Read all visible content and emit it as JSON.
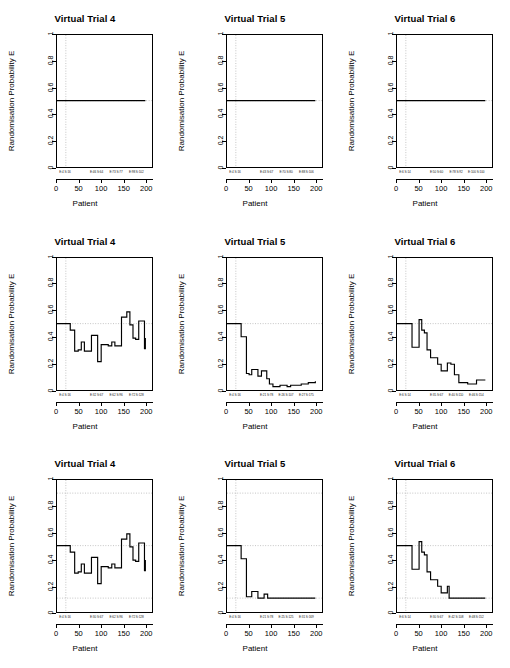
{
  "figure": {
    "rows": 3,
    "cols": 3,
    "axis_title_x": "Patient",
    "axis_title_y": "Randomisation Probability E",
    "line_color": "#000000",
    "grid_color": "#9a9a9a",
    "background": "#ffffff"
  },
  "chart_data": [
    {
      "type": "line",
      "title": "Virtual Trial 4",
      "xlabel": "Patient",
      "ylabel": "Randomisation Probability E",
      "xlim": [
        0,
        215
      ],
      "ylim": [
        0,
        1
      ],
      "xticks": [
        0,
        50,
        100,
        150,
        200
      ],
      "yticks": [
        0.0,
        0.2,
        0.4,
        0.6,
        0.8,
        1.0
      ],
      "grid": false,
      "vlines": [
        20
      ],
      "hlines": [
        0.5
      ],
      "step": true,
      "annotations": [
        {
          "x": 20,
          "text": "E:4 S:16"
        },
        {
          "x": 90,
          "text": "E:46 S:64"
        },
        {
          "x": 133,
          "text": "E:73 S:77"
        },
        {
          "x": 178,
          "text": "E:98 S:102"
        }
      ],
      "x": [
        0,
        20,
        200
      ],
      "values": [
        0.5,
        0.5,
        0.5
      ]
    },
    {
      "type": "line",
      "title": "Virtual Trial 5",
      "xlabel": "Patient",
      "ylabel": "Randomisation Probability E",
      "xlim": [
        0,
        215
      ],
      "ylim": [
        0,
        1
      ],
      "xticks": [
        0,
        50,
        100,
        150,
        200
      ],
      "yticks": [
        0.0,
        0.2,
        0.4,
        0.6,
        0.8,
        1.0
      ],
      "grid": false,
      "vlines": [
        20
      ],
      "hlines": [
        0.5
      ],
      "step": true,
      "annotations": [
        {
          "x": 20,
          "text": "E:4 S:16"
        },
        {
          "x": 90,
          "text": "E:43 S:67"
        },
        {
          "x": 133,
          "text": "E:70 S:80"
        },
        {
          "x": 178,
          "text": "E:88 S:106"
        }
      ],
      "x": [
        0,
        20,
        200
      ],
      "values": [
        0.5,
        0.5,
        0.5
      ]
    },
    {
      "type": "line",
      "title": "Virtual Trial 6",
      "xlabel": "Patient",
      "ylabel": "Randomisation Probability E",
      "xlim": [
        0,
        215
      ],
      "ylim": [
        0,
        1
      ],
      "xticks": [
        0,
        50,
        100,
        150,
        200
      ],
      "yticks": [
        0.0,
        0.2,
        0.4,
        0.6,
        0.8,
        1.0
      ],
      "grid": false,
      "vlines": [
        20
      ],
      "hlines": [
        0.5
      ],
      "step": true,
      "annotations": [
        {
          "x": 20,
          "text": "E:6 S:14"
        },
        {
          "x": 90,
          "text": "E:50 S:60"
        },
        {
          "x": 133,
          "text": "E:78 S:92"
        },
        {
          "x": 178,
          "text": "E:100 S:100"
        }
      ],
      "x": [
        0,
        20,
        200
      ],
      "values": [
        0.5,
        0.5,
        0.5
      ]
    },
    {
      "type": "line",
      "title": "Virtual Trial 4",
      "xlabel": "Patient",
      "ylabel": "Randomisation Probability E",
      "xlim": [
        0,
        215
      ],
      "ylim": [
        0,
        1
      ],
      "xticks": [
        0,
        50,
        100,
        150,
        200
      ],
      "yticks": [
        0.0,
        0.2,
        0.4,
        0.6,
        0.8,
        1.0
      ],
      "grid": false,
      "vlines": [
        20
      ],
      "hlines": [
        0.5
      ],
      "step": true,
      "annotations": [
        {
          "x": 20,
          "text": "E:4 S:16"
        },
        {
          "x": 90,
          "text": "E:32 S:67"
        },
        {
          "x": 133,
          "text": "E:62 S:96"
        },
        {
          "x": 178,
          "text": "E:72 S:128"
        }
      ],
      "x": [
        0,
        20,
        30,
        40,
        48,
        55,
        62,
        70,
        78,
        84,
        92,
        100,
        108,
        116,
        124,
        131,
        138,
        146,
        152,
        158,
        165,
        172,
        178,
        185,
        192,
        198,
        200
      ],
      "values": [
        0.5,
        0.5,
        0.45,
        0.29,
        0.3,
        0.36,
        0.29,
        0.29,
        0.41,
        0.41,
        0.21,
        0.34,
        0.34,
        0.33,
        0.36,
        0.33,
        0.33,
        0.55,
        0.55,
        0.59,
        0.49,
        0.39,
        0.38,
        0.52,
        0.52,
        0.31,
        0.39
      ]
    },
    {
      "type": "line",
      "title": "Virtual Trial 5",
      "xlabel": "Patient",
      "ylabel": "Randomisation Probability E",
      "xlim": [
        0,
        215
      ],
      "ylim": [
        0,
        1
      ],
      "xticks": [
        0,
        50,
        100,
        150,
        200
      ],
      "yticks": [
        0.0,
        0.2,
        0.4,
        0.6,
        0.8,
        1.0
      ],
      "grid": false,
      "vlines": [
        20
      ],
      "hlines": [
        0.5
      ],
      "step": true,
      "annotations": [
        {
          "x": 20,
          "text": "E:4 S:16"
        },
        {
          "x": 90,
          "text": "E:21 S:78"
        },
        {
          "x": 133,
          "text": "E:26 S:107"
        },
        {
          "x": 178,
          "text": "E:27 S:175"
        }
      ],
      "x": [
        0,
        20,
        32,
        38,
        44,
        50,
        56,
        62,
        70,
        78,
        84,
        90,
        96,
        104,
        112,
        120,
        128,
        136,
        144,
        152,
        160,
        168,
        176,
        184,
        192,
        200
      ],
      "values": [
        0.5,
        0.5,
        0.4,
        0.4,
        0.12,
        0.11,
        0.15,
        0.15,
        0.1,
        0.14,
        0.14,
        0.08,
        0.04,
        0.02,
        0.02,
        0.03,
        0.03,
        0.02,
        0.03,
        0.03,
        0.03,
        0.04,
        0.04,
        0.05,
        0.05,
        0.06
      ]
    },
    {
      "type": "line",
      "title": "Virtual Trial 6",
      "xlabel": "Patient",
      "ylabel": "Randomisation Probability E",
      "xlim": [
        0,
        215
      ],
      "ylim": [
        0,
        1
      ],
      "xticks": [
        0,
        50,
        100,
        150,
        200
      ],
      "yticks": [
        0.0,
        0.2,
        0.4,
        0.6,
        0.8,
        1.0
      ],
      "grid": false,
      "vlines": [
        20
      ],
      "hlines": [
        0.5
      ],
      "step": true,
      "annotations": [
        {
          "x": 20,
          "text": "E:6 S:14"
        },
        {
          "x": 90,
          "text": "E:35 S:67"
        },
        {
          "x": 133,
          "text": "E:40 S:110"
        },
        {
          "x": 178,
          "text": "E:46 S:154"
        }
      ],
      "x": [
        0,
        20,
        28,
        34,
        42,
        50,
        56,
        62,
        68,
        76,
        84,
        92,
        100,
        108,
        114,
        122,
        130,
        140,
        150,
        160,
        170,
        180,
        190,
        200
      ],
      "values": [
        0.5,
        0.5,
        0.5,
        0.32,
        0.32,
        0.53,
        0.45,
        0.43,
        0.3,
        0.24,
        0.24,
        0.19,
        0.14,
        0.14,
        0.2,
        0.19,
        0.11,
        0.05,
        0.05,
        0.04,
        0.04,
        0.07,
        0.07,
        0.07
      ]
    },
    {
      "type": "line",
      "title": "Virtual Trial 4",
      "xlabel": "Patient",
      "ylabel": "Randomisation Probability E",
      "xlim": [
        0,
        215
      ],
      "ylim": [
        0,
        1
      ],
      "xticks": [
        0,
        50,
        100,
        150,
        200
      ],
      "yticks": [
        0.0,
        0.2,
        0.4,
        0.6,
        0.8,
        1.0
      ],
      "grid": false,
      "vlines": [
        20
      ],
      "hlines": [
        0.1,
        0.5,
        0.9
      ],
      "step": true,
      "annotations": [
        {
          "x": 20,
          "text": "E:4 S:16"
        },
        {
          "x": 90,
          "text": "E:30 S:67"
        },
        {
          "x": 133,
          "text": "E:62 S:96"
        },
        {
          "x": 178,
          "text": "E:72 S:128"
        }
      ],
      "x": [
        0,
        20,
        30,
        40,
        48,
        55,
        62,
        70,
        78,
        84,
        92,
        100,
        108,
        116,
        124,
        131,
        138,
        146,
        152,
        158,
        165,
        172,
        178,
        185,
        192,
        198,
        200
      ],
      "values": [
        0.5,
        0.5,
        0.45,
        0.29,
        0.3,
        0.36,
        0.29,
        0.29,
        0.41,
        0.41,
        0.21,
        0.34,
        0.34,
        0.33,
        0.36,
        0.33,
        0.33,
        0.55,
        0.55,
        0.59,
        0.49,
        0.39,
        0.38,
        0.52,
        0.52,
        0.31,
        0.39
      ]
    },
    {
      "type": "line",
      "title": "Virtual Trial 5",
      "xlabel": "Patient",
      "ylabel": "Randomisation Probability E",
      "xlim": [
        0,
        215
      ],
      "ylim": [
        0,
        1
      ],
      "xticks": [
        0,
        50,
        100,
        150,
        200
      ],
      "yticks": [
        0.0,
        0.2,
        0.4,
        0.6,
        0.8,
        1.0
      ],
      "grid": false,
      "vlines": [
        20
      ],
      "hlines": [
        0.1,
        0.5,
        0.9
      ],
      "step": true,
      "annotations": [
        {
          "x": 20,
          "text": "E:4 S:16"
        },
        {
          "x": 90,
          "text": "E:21 S:78"
        },
        {
          "x": 133,
          "text": "E:25 S:125"
        },
        {
          "x": 178,
          "text": "E:31 S:169"
        }
      ],
      "x": [
        0,
        20,
        32,
        38,
        44,
        50,
        56,
        62,
        70,
        78,
        84,
        92,
        100,
        120,
        140,
        160,
        180,
        200
      ],
      "values": [
        0.5,
        0.5,
        0.4,
        0.4,
        0.11,
        0.11,
        0.15,
        0.15,
        0.1,
        0.1,
        0.13,
        0.1,
        0.1,
        0.1,
        0.1,
        0.1,
        0.1,
        0.1
      ]
    },
    {
      "type": "line",
      "title": "Virtual Trial 6",
      "xlabel": "Patient",
      "ylabel": "Randomisation Probability E",
      "xlim": [
        0,
        215
      ],
      "ylim": [
        0,
        1
      ],
      "xticks": [
        0,
        50,
        100,
        150,
        200
      ],
      "yticks": [
        0.0,
        0.2,
        0.4,
        0.6,
        0.8,
        1.0
      ],
      "grid": false,
      "vlines": [
        20
      ],
      "hlines": [
        0.1,
        0.5,
        0.9
      ],
      "step": true,
      "annotations": [
        {
          "x": 20,
          "text": "E:6 S:14"
        },
        {
          "x": 90,
          "text": "E:30 S:67"
        },
        {
          "x": 133,
          "text": "E:42 S:108"
        },
        {
          "x": 178,
          "text": "E:48 S:152"
        }
      ],
      "x": [
        0,
        20,
        28,
        34,
        42,
        50,
        56,
        62,
        68,
        76,
        84,
        92,
        100,
        108,
        114,
        118,
        130,
        145,
        160,
        175,
        190,
        200
      ],
      "values": [
        0.5,
        0.5,
        0.5,
        0.32,
        0.32,
        0.53,
        0.45,
        0.43,
        0.3,
        0.24,
        0.24,
        0.19,
        0.14,
        0.14,
        0.19,
        0.1,
        0.1,
        0.1,
        0.1,
        0.1,
        0.1,
        0.1
      ]
    }
  ]
}
